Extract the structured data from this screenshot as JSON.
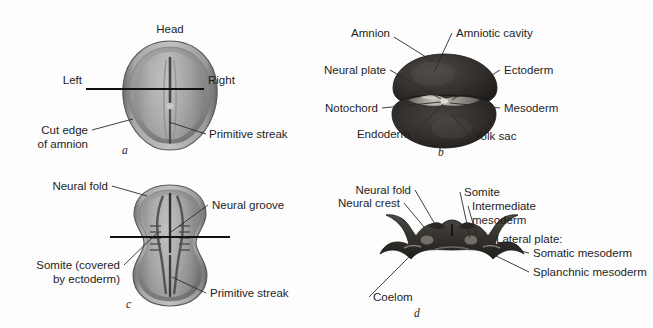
{
  "figure": {
    "background_color": "#fdfdfd",
    "text_color": "#1d1d1d"
  },
  "panels": [
    {
      "letter": "a",
      "name": "dorsal-view-early-embryo",
      "labels": [
        {
          "id": "head",
          "text": "Head"
        },
        {
          "id": "left",
          "text": "Left"
        },
        {
          "id": "right",
          "text": "Right"
        },
        {
          "id": "cut-edge-of-amnion-line1",
          "text": "Cut edge"
        },
        {
          "id": "cut-edge-of-amnion-line2",
          "text": "of amnion"
        },
        {
          "id": "primitive-streak",
          "text": "Primitive streak"
        }
      ]
    },
    {
      "letter": "b",
      "name": "cross-section-presomite-embryo",
      "labels": [
        {
          "id": "amnion",
          "text": "Amnion"
        },
        {
          "id": "amniotic-cavity",
          "text": "Amniotic cavity"
        },
        {
          "id": "neural-plate",
          "text": "Neural plate"
        },
        {
          "id": "ectoderm",
          "text": "Ectoderm"
        },
        {
          "id": "notochord",
          "text": "Notochord"
        },
        {
          "id": "mesoderm",
          "text": "Mesoderm"
        },
        {
          "id": "endoderm",
          "text": "Endoderm"
        },
        {
          "id": "yolk-sac",
          "text": "Yolk sac"
        }
      ]
    },
    {
      "letter": "c",
      "name": "dorsal-view-somite-embryo",
      "labels": [
        {
          "id": "neural-fold",
          "text": "Neural fold"
        },
        {
          "id": "neural-groove",
          "text": "Neural groove"
        },
        {
          "id": "somite-covered-line1",
          "text": "Somite (covered"
        },
        {
          "id": "somite-covered-line2",
          "text": "by ectoderm)"
        },
        {
          "id": "primitive-streak",
          "text": "Primitive streak"
        }
      ]
    },
    {
      "letter": "d",
      "name": "cross-section-somite-embryo",
      "labels": [
        {
          "id": "neural-fold",
          "text": "Neural fold"
        },
        {
          "id": "neural-crest",
          "text": "Neural crest"
        },
        {
          "id": "somite",
          "text": "Somite"
        },
        {
          "id": "intermediate-mesoderm-line1",
          "text": "Intermediate"
        },
        {
          "id": "intermediate-mesoderm-line2",
          "text": "mesoderm"
        },
        {
          "id": "lateral-plate-heading",
          "text": "Lateral plate:"
        },
        {
          "id": "somatic-mesoderm",
          "text": "Somatic mesoderm"
        },
        {
          "id": "splanchnic-mesoderm",
          "text": "Splanchnic mesoderm"
        },
        {
          "id": "coelom",
          "text": "Coelom"
        }
      ]
    }
  ]
}
